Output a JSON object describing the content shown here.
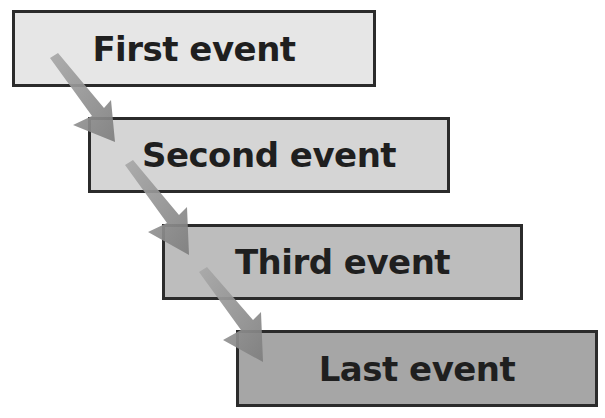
{
  "diagram": {
    "type": "sequence-flow",
    "background": "#ffffff",
    "events": [
      {
        "label": "First event",
        "fill": "#e6e6e6",
        "x": 12,
        "y": 10,
        "w": 364,
        "h": 77
      },
      {
        "label": "Second event",
        "fill": "#d5d5d5",
        "x": 88,
        "y": 117,
        "w": 362,
        "h": 76
      },
      {
        "label": "Third event",
        "fill": "#bdbdbd",
        "x": 162,
        "y": 224,
        "w": 361,
        "h": 76
      },
      {
        "label": "Last event",
        "fill": "#a6a6a6",
        "x": 236,
        "y": 330,
        "w": 362,
        "h": 77
      }
    ],
    "arrows": [
      {
        "from": "First event",
        "to": "Second event",
        "color": "#8a8a8a"
      },
      {
        "from": "Second event",
        "to": "Third event",
        "color": "#8a8a8a"
      },
      {
        "from": "Third event",
        "to": "Last event",
        "color": "#8a8a8a"
      }
    ]
  }
}
